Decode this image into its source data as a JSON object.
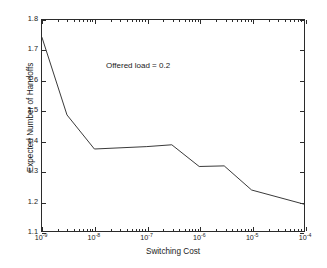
{
  "chart_data": {
    "type": "line",
    "title": "",
    "xlabel": "Switching Cost",
    "ylabel": "Expected Number of Handoffs",
    "xscale": "log",
    "yscale": "linear",
    "xlim": [
      1e-09,
      0.0001
    ],
    "ylim": [
      1.1,
      1.8
    ],
    "grid": false,
    "legend": null,
    "annotations": [
      {
        "text": "Offered load = 0.2",
        "x": 4e-08,
        "y": 1.62
      }
    ],
    "xticklabels": [
      {
        "mantissa": "10",
        "exponent": "-9",
        "value": 1e-09
      },
      {
        "mantissa": "10",
        "exponent": "-8",
        "value": 1e-08
      },
      {
        "mantissa": "10",
        "exponent": "-7",
        "value": 1e-07
      },
      {
        "mantissa": "10",
        "exponent": "-6",
        "value": 1e-06
      },
      {
        "mantissa": "10",
        "exponent": "-5",
        "value": 1e-05
      },
      {
        "mantissa": "10",
        "exponent": "-4",
        "value": 0.0001
      }
    ],
    "yticklabels": [
      "1.1",
      "1.2",
      "1.3",
      "1.4",
      "1.5",
      "1.6",
      "1.7",
      "1.8"
    ],
    "yticks": [
      1.1,
      1.2,
      1.3,
      1.4,
      1.5,
      1.6,
      1.7,
      1.8
    ],
    "series": [
      {
        "name": "Expected Number of Handoffs",
        "color": "#3a3a3a",
        "linewidth": 1.0,
        "x": [
          1e-09,
          3e-09,
          1e-08,
          1e-07,
          3e-07,
          1e-06,
          3e-06,
          1e-05,
          0.0001
        ],
        "y": [
          1.742,
          1.485,
          1.372,
          1.38,
          1.386,
          1.314,
          1.316,
          1.236,
          1.189
        ]
      }
    ]
  },
  "figure": {
    "background_color": "#ffffff",
    "axis_color": "#2b2b2b",
    "text_color": "#1a1a1a"
  }
}
